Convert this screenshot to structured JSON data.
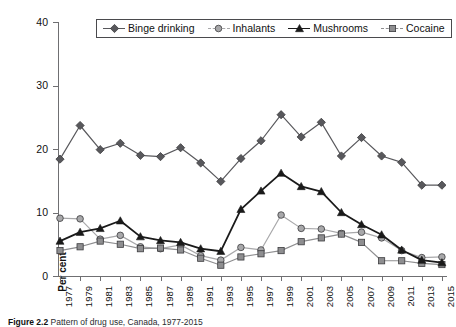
{
  "figure": {
    "top_partial_text": "",
    "caption_label": "Figure",
    "caption_number": "2.2",
    "caption_text": "Pattern of drug use, Canada, 1977-2015"
  },
  "axis": {
    "y_title": "Per cent",
    "y_ticks": [
      0,
      10,
      20,
      30,
      40
    ],
    "y_min": 0,
    "y_max": 40,
    "x_tick_labels": [
      "1977",
      "1979",
      "1981",
      "1983",
      "1985",
      "1987",
      "1989",
      "1991",
      "1993",
      "1995",
      "1997",
      "1999",
      "2001",
      "2003",
      "2005",
      "2007",
      "2009",
      "2011",
      "2013",
      "2015"
    ]
  },
  "legend": {
    "position": "top-center",
    "items": [
      {
        "label": "Binge drinking",
        "marker": "diamond-marker",
        "color": "#58585c"
      },
      {
        "label": "Inhalants",
        "marker": "circle-marker",
        "color": "#a8a8aa"
      },
      {
        "label": "Mushrooms",
        "marker": "triangle-marker",
        "color": "#1a1a1a"
      },
      {
        "label": "Cocaine",
        "marker": "square-marker",
        "color": "#8e8e90"
      }
    ]
  },
  "chart_data": {
    "type": "line",
    "title": "",
    "subtitle": "",
    "xlabel": "",
    "ylabel": "Per cent",
    "ylim": [
      0,
      40
    ],
    "grid": false,
    "legend_position": "top-center",
    "x": [
      1977,
      1979,
      1981,
      1983,
      1985,
      1987,
      1989,
      1991,
      1993,
      1995,
      1997,
      1999,
      2001,
      2003,
      2005,
      2007,
      2009,
      2011,
      2013,
      2015
    ],
    "series": [
      {
        "name": "Binge drinking",
        "color": "#58585c",
        "marker": "diamond",
        "values": [
          18.4,
          23.7,
          19.9,
          20.9,
          19.0,
          18.8,
          20.2,
          17.8,
          14.9,
          18.5,
          21.3,
          25.4,
          21.9,
          24.2,
          18.9,
          21.8,
          18.9,
          17.9,
          14.3,
          14.3
        ]
      },
      {
        "name": "Inhalants",
        "color": "#a8a8aa",
        "marker": "circle",
        "values": [
          9.1,
          9.0,
          5.8,
          6.4,
          4.6,
          4.3,
          4.9,
          3.2,
          2.5,
          4.5,
          4.1,
          9.6,
          7.5,
          7.4,
          6.7,
          6.9,
          6.0,
          4.0,
          2.9,
          3.0
        ]
      },
      {
        "name": "Mushrooms",
        "color": "#1a1a1a",
        "marker": "triangle",
        "values": [
          5.5,
          6.9,
          7.5,
          8.7,
          6.2,
          5.6,
          5.3,
          4.3,
          3.9,
          10.5,
          13.4,
          16.2,
          14.1,
          13.3,
          10.0,
          8.1,
          6.5,
          4.1,
          2.5,
          2.1
        ]
      },
      {
        "name": "Cocaine",
        "color": "#8e8e90",
        "marker": "square",
        "values": [
          4.0,
          4.6,
          5.5,
          5.0,
          4.3,
          4.4,
          4.1,
          2.8,
          1.7,
          3.0,
          3.5,
          4.0,
          5.4,
          6.0,
          6.6,
          5.3,
          2.4,
          2.4,
          2.0,
          1.8
        ]
      }
    ]
  }
}
